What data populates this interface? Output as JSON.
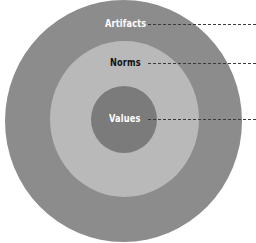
{
  "diagram": {
    "type": "concentric-circles",
    "layers": [
      {
        "id": "outer",
        "label": "Artifacts",
        "fill": "#8c8c8c",
        "label_color": "#ffffff"
      },
      {
        "id": "middle",
        "label": "Norms",
        "fill": "#b9b9b9",
        "label_color": "#111111"
      },
      {
        "id": "inner",
        "label": "Values",
        "fill": "#7b7b7b",
        "label_color": "#ffffff"
      }
    ],
    "leader_line_color": "#3a3a3a",
    "background": "#ffffff"
  }
}
